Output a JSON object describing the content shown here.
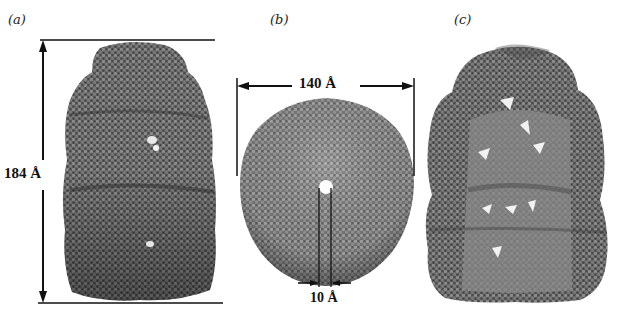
{
  "figure": {
    "panels": [
      {
        "id": "a",
        "label": "(a)",
        "view": "side view",
        "dimension": {
          "label": "184 Å",
          "value": 184,
          "unit": "Å",
          "orientation": "vertical"
        }
      },
      {
        "id": "b",
        "label": "(b)",
        "view": "top view",
        "dimension": {
          "label": "140 Å",
          "value": 140,
          "unit": "Å",
          "orientation": "horizontal"
        },
        "pore": {
          "label": "10 Å",
          "value": 10,
          "unit": "Å"
        }
      },
      {
        "id": "c",
        "label": "(c)",
        "view": "cut-away side view"
      }
    ],
    "colors": {
      "molecule_dark": "#3a3a3a",
      "molecule_mid": "#6e6e6e",
      "molecule_light": "#9a9a9a",
      "annotation": "#111111",
      "background": "#ffffff"
    }
  }
}
